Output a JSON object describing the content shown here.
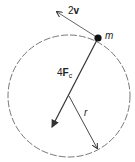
{
  "diagram": {
    "type": "uniform circular motion",
    "circle": {
      "cx": 69,
      "cy": 96,
      "r": 61,
      "style": "dashed"
    },
    "mass": {
      "label": "m",
      "x": 98,
      "y": 38
    },
    "velocity": {
      "coefficient": "2",
      "symbol": "v",
      "from": [
        98,
        38
      ],
      "to": [
        57,
        12
      ]
    },
    "force": {
      "coefficient": "4",
      "symbol": "F",
      "subscript": "c",
      "from": [
        98,
        38
      ],
      "to": [
        52,
        127
      ]
    },
    "radius": {
      "label": "r",
      "from": [
        69,
        96
      ],
      "to": [
        97,
        148
      ]
    },
    "colors": {
      "line": "#333333",
      "mass": "#111111",
      "circle": "#555555"
    }
  }
}
